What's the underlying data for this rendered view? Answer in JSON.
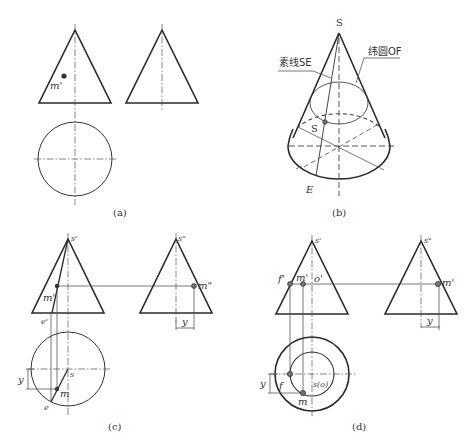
{
  "figure": {
    "panels": [
      {
        "id": "a",
        "caption": "(a)",
        "labels": {
          "m_front": "m'"
        }
      },
      {
        "id": "b",
        "caption": "(b)",
        "labels": {
          "apex": "S",
          "generatrix": "素线SE",
          "latitude_circle": "纬圆OF",
          "point_s": "S",
          "point_e": "E"
        }
      },
      {
        "id": "c",
        "caption": "(c)",
        "labels": {
          "s_front": "s'",
          "s_side": "s\"",
          "m_front": "m'",
          "m_side": "m\"",
          "e_front": "e'",
          "s_top": "s",
          "m_top": "m",
          "e_top": "e",
          "y_side": "y",
          "y_top": "y"
        }
      },
      {
        "id": "d",
        "caption": "(d)",
        "labels": {
          "s_front": "s'",
          "s_side": "s\"",
          "f_front": "f'",
          "m_front": "m'",
          "o_front": "o'",
          "m_side": "m'",
          "f_top": "f",
          "s_top": "s(o)",
          "m_top": "m",
          "y_side": "y",
          "y_top": "y"
        }
      }
    ]
  },
  "colors": {
    "line": "#2a2a2a",
    "thin_line": "#555555",
    "background": "#ffffff"
  }
}
